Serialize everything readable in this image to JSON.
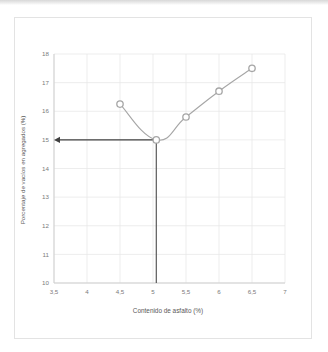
{
  "figure": {
    "background_color": "#ffffff",
    "frame_border_color": "#e3e3e3"
  },
  "chart_data": {
    "type": "line",
    "title": "",
    "subtitle": "",
    "xlabel": "Contenido de asfalto (%)",
    "ylabel": "Porcentaje de vacíos en agregados (%)",
    "xlim": [
      3.5,
      7
    ],
    "ylim": [
      10,
      18
    ],
    "xticks": [
      3.5,
      4,
      4.5,
      5,
      5.5,
      6,
      6.5,
      7
    ],
    "xtick_labels": [
      "3,5",
      "4",
      "4,5",
      "5",
      "5,5",
      "6",
      "6,5",
      "7"
    ],
    "yticks": [
      10,
      11,
      12,
      13,
      14,
      15,
      16,
      17,
      18
    ],
    "ytick_labels": [
      "10",
      "11",
      "12",
      "13",
      "14",
      "15",
      "16",
      "17",
      "18"
    ],
    "grid": true,
    "grid_color": "#e8e8e8",
    "legend": false,
    "legend_position": "none",
    "series": [
      {
        "name": "VMA",
        "line_color": "#a6a6a6",
        "marker": "circle-open",
        "marker_edge_color": "#a6a6a6",
        "marker_face_color": "#ffffff",
        "x": [
          4.5,
          5.05,
          5.5,
          6.0,
          6.5
        ],
        "y": [
          16.25,
          15.0,
          15.8,
          16.7,
          17.5
        ]
      }
    ],
    "annotations": [
      {
        "name": "horizontal-construction-arrow",
        "type": "arrow",
        "color": "#404040",
        "from_x": 5.05,
        "from_y": 15.0,
        "to_x": 3.5,
        "to_y": 15.0,
        "label": ""
      },
      {
        "name": "vertical-construction-line",
        "type": "line",
        "color": "#595959",
        "from_x": 5.05,
        "from_y": 15.0,
        "to_x": 5.05,
        "to_y": 10.0,
        "label": ""
      },
      {
        "name": "optimum-point-marker",
        "type": "point",
        "color": "#1a1a1a",
        "x": 5.05,
        "y": 15.0,
        "label": ""
      }
    ]
  }
}
